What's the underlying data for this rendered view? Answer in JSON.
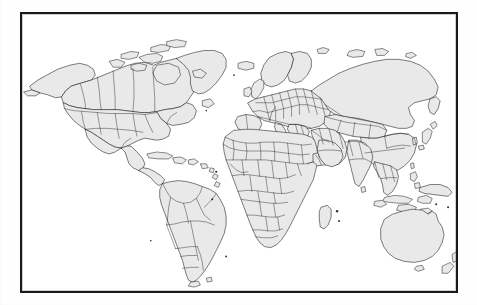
{
  "document": {
    "kind": "scanned-world-map",
    "title": "World Political Map",
    "has_text_labels": false,
    "has_legend": false,
    "has_graticule": false,
    "orientation": "landscape"
  },
  "canvas": {
    "width_px": 477,
    "height_px": 305,
    "background_color": "#fefefe",
    "paper_tone": "white photocopy"
  },
  "frame": {
    "name": "map-border-frame",
    "left_px": 20,
    "top_px": 12,
    "width_px": 438,
    "height_px": 281,
    "border_color": "#1a1a1a",
    "border_width_px": 2,
    "fill_color": "#ffffff"
  },
  "style": {
    "land_fill": "#e9e9e9",
    "coastline_color": "#141414",
    "country_border_color": "#141414",
    "ocean_fill": "#ffffff",
    "coastline_width": 0.55,
    "country_border_width": 0.42
  },
  "map": {
    "projection": "equirectangular-like",
    "extent": "global",
    "shows_country_borders": true,
    "landmasses": [
      {
        "name": "north-america",
        "includes": [
          "Alaska",
          "Canada",
          "United States",
          "Mexico",
          "Greenland"
        ]
      },
      {
        "name": "central-america-caribbean",
        "includes": [
          "Guatemala",
          "Honduras",
          "Nicaragua",
          "Costa Rica",
          "Panama",
          "Cuba",
          "Hispaniola"
        ]
      },
      {
        "name": "south-america",
        "includes": [
          "Colombia",
          "Venezuela",
          "Brazil",
          "Peru",
          "Bolivia",
          "Chile",
          "Argentina",
          "Paraguay",
          "Uruguay",
          "Ecuador",
          "Guyana"
        ]
      },
      {
        "name": "europe",
        "includes": [
          "Iceland",
          "United Kingdom",
          "Ireland",
          "Norway",
          "Sweden",
          "Finland",
          "France",
          "Spain",
          "Portugal",
          "Germany",
          "Poland",
          "Italy",
          "Greece",
          "Ukraine",
          "Romania"
        ]
      },
      {
        "name": "africa",
        "includes": [
          "Morocco",
          "Algeria",
          "Libya",
          "Egypt",
          "Sudan",
          "Ethiopia",
          "Nigeria",
          "Chad",
          "Niger",
          "Mali",
          "Congo",
          "Angola",
          "Namibia",
          "South Africa",
          "Tanzania",
          "Kenya",
          "Madagascar"
        ]
      },
      {
        "name": "asia",
        "includes": [
          "Russia",
          "Kazakhstan",
          "Mongolia",
          "China",
          "India",
          "Pakistan",
          "Iran",
          "Saudi Arabia",
          "Turkey",
          "Japan",
          "Korea",
          "Thailand",
          "Vietnam",
          "Myanmar",
          "Indonesia",
          "Philippines"
        ]
      },
      {
        "name": "oceania",
        "includes": [
          "Australia",
          "New Zealand",
          "Papua New Guinea"
        ]
      },
      {
        "name": "island-groups",
        "includes": [
          "Sri Lanka",
          "Taiwan",
          "Madagascar",
          "Svalbard",
          "Novaya Zemlya",
          "Falkland Islands"
        ]
      }
    ]
  }
}
